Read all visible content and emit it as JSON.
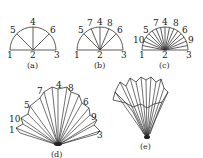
{
  "figure": {
    "panels": [
      {
        "id": "a",
        "caption": "(a)",
        "labels": [
          "1",
          "2",
          "3",
          "4",
          "5",
          "6"
        ]
      },
      {
        "id": "b",
        "caption": "(b)",
        "labels": [
          "1",
          "2",
          "3",
          "4",
          "5",
          "6",
          "7",
          "8"
        ]
      },
      {
        "id": "c",
        "caption": "(c)",
        "labels": [
          "1",
          "2",
          "3",
          "4",
          "5",
          "6",
          "7",
          "8",
          "9",
          "10"
        ]
      },
      {
        "id": "d",
        "caption": "(d)",
        "labels": [
          "1",
          "3",
          "4",
          "5",
          "6",
          "7",
          "8",
          "9",
          "10"
        ]
      },
      {
        "id": "e",
        "caption": "(e)",
        "labels": []
      }
    ]
  },
  "colors": {
    "line": "#333333",
    "text": "#222222",
    "background": "#ffffff"
  }
}
